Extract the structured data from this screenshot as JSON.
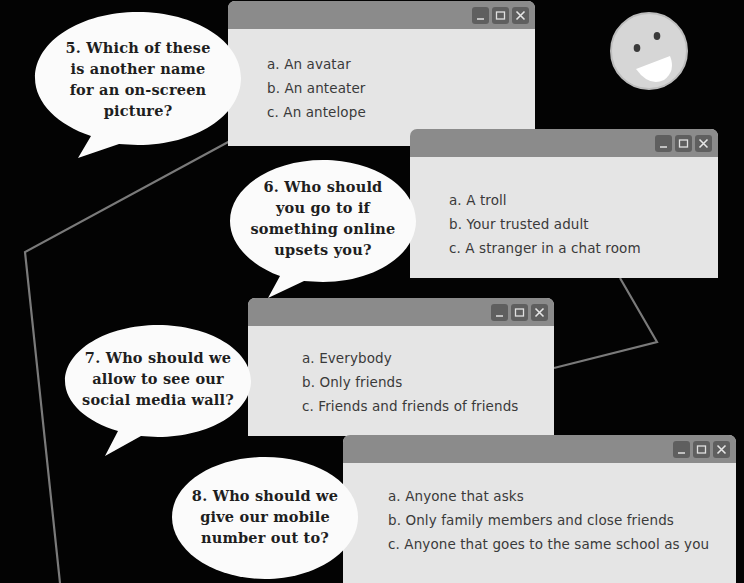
{
  "colors": {
    "background": "#030303",
    "titlebar": "#8b8b8b",
    "window_body": "#e5e5e5",
    "control_button": "#5f5f5f",
    "connector_line": "#7a7a7a",
    "bubble": "#fbfbfb",
    "smiley_face": "#d9d9d9"
  },
  "window_controls": [
    "minimize-icon",
    "maximize-icon",
    "close-icon"
  ],
  "questions": [
    {
      "number": "5",
      "text": "5. Which of these is another name for an on-screen picture?",
      "lines": [
        "5. Which of these",
        "is another name",
        "for an on-screen",
        "picture?"
      ],
      "options": [
        "a. An avatar",
        "b. An anteater",
        "c. An antelope"
      ]
    },
    {
      "number": "6",
      "text": "6. Who should you go to if something online upsets you?",
      "lines": [
        "6. Who should",
        "you go to if",
        "something online",
        "upsets you?"
      ],
      "options": [
        "a. A troll",
        "b. Your trusted adult",
        "c. A stranger in a chat room"
      ]
    },
    {
      "number": "7",
      "text": "7. Who should we allow to see our social media wall?",
      "lines": [
        "7. Who should we",
        "allow to see our",
        "social media wall?"
      ],
      "options": [
        "a. Everybody",
        "b. Only friends",
        "c. Friends and friends of friends"
      ]
    },
    {
      "number": "8",
      "text": "8. Who should we give our mobile number out to?",
      "lines": [
        "8. Who should we",
        "give our mobile",
        "number out to?"
      ],
      "options": [
        "a. Anyone that asks",
        "b. Only family members and close friends",
        "c. Anyone that goes to the same school as you"
      ]
    }
  ],
  "decoration": {
    "smiley": "smiley-face-icon"
  }
}
